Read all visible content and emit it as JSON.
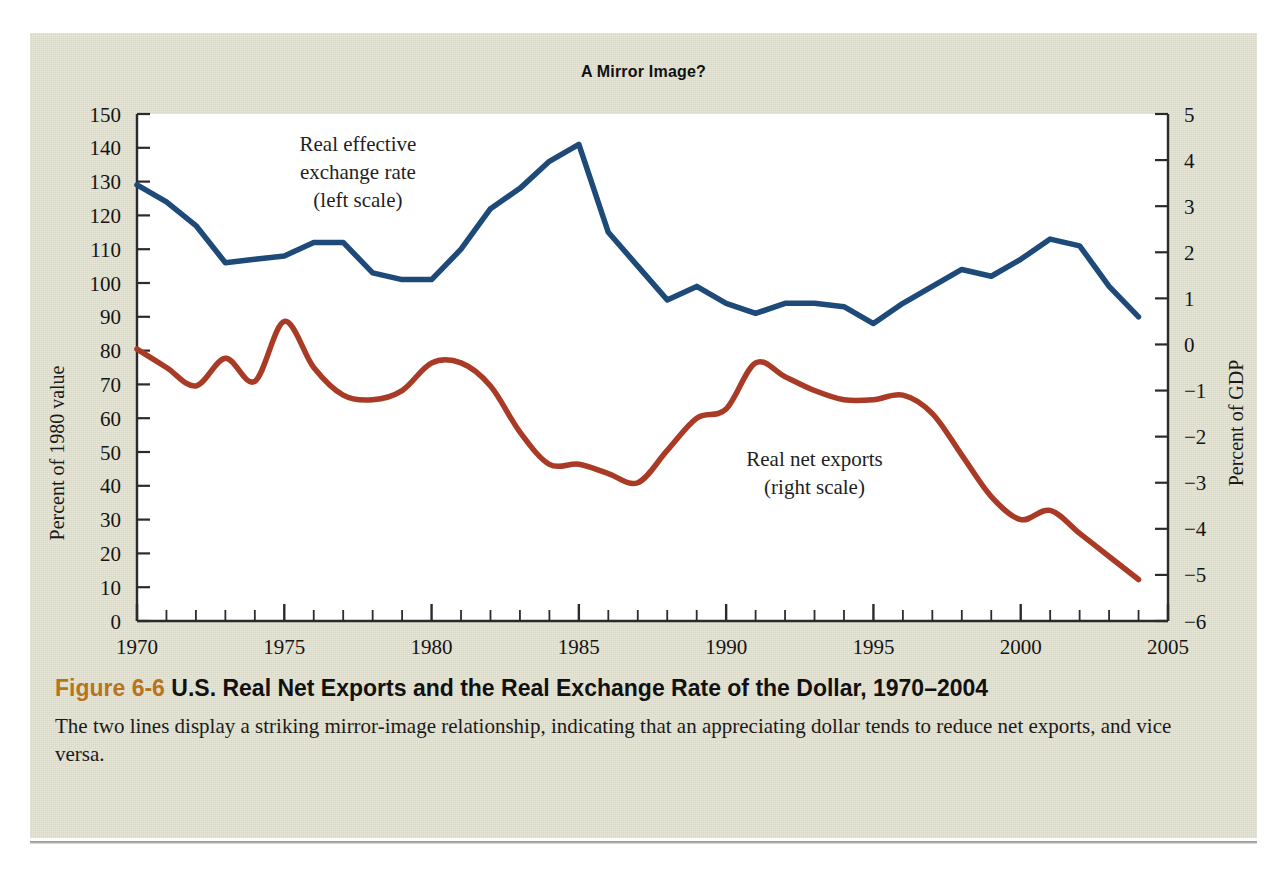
{
  "figure": {
    "chart_title": "A Mirror Image?",
    "caption_figure_number": "Figure 6-6",
    "caption_title": " U.S. Real Net Exports and the Real Exchange Rate of the Dollar, 1970–2004",
    "caption_body": "The two lines display a striking mirror-image relationship, indicating that an appreciating dollar tends to reduce net exports, and vice versa.",
    "accent_color": "#b8741a",
    "panel_color": "#d9d8c6"
  },
  "chart_data": {
    "type": "line",
    "title": "A Mirror Image?",
    "xlabel": "",
    "ylabel": "Percent of 1980 value",
    "y2label": "Percent of GDP",
    "xlim": [
      1970,
      2005
    ],
    "ylim": [
      0,
      150
    ],
    "y2lim": [
      -6,
      5
    ],
    "grid": false,
    "legend": "inline-annotations",
    "x_ticks": [
      1970,
      1975,
      1980,
      1985,
      1990,
      1995,
      2000,
      2005
    ],
    "x_minor_tick_step": 1,
    "y_ticks": [
      0,
      10,
      20,
      30,
      40,
      50,
      60,
      70,
      80,
      90,
      100,
      110,
      120,
      130,
      140,
      150
    ],
    "y2_ticks": [
      -6,
      -5,
      -4,
      -3,
      -2,
      -1,
      0,
      1,
      2,
      3,
      4,
      5
    ],
    "x": [
      1970,
      1971,
      1972,
      1973,
      1974,
      1975,
      1976,
      1977,
      1978,
      1979,
      1980,
      1981,
      1982,
      1983,
      1984,
      1985,
      1986,
      1987,
      1988,
      1989,
      1990,
      1991,
      1992,
      1993,
      1994,
      1995,
      1996,
      1997,
      1998,
      1999,
      2000,
      2001,
      2002,
      2003,
      2004
    ],
    "series": [
      {
        "name": "Real effective exchange rate",
        "scale_note": "(left scale)",
        "axis": "left",
        "color": "#1d4a78",
        "units": "Percent of 1980 value",
        "values": [
          129,
          124,
          117,
          106,
          107,
          108,
          112,
          112,
          103,
          101,
          101,
          110,
          122,
          128,
          136,
          141,
          115,
          105,
          95,
          99,
          94,
          91,
          94,
          94,
          93,
          88,
          94,
          99,
          104,
          102,
          107,
          113,
          111,
          99,
          90
        ]
      },
      {
        "name": "Real net exports",
        "scale_note": "(right scale)",
        "axis": "right",
        "color": "#a93b26",
        "units": "Percent of GDP",
        "values": [
          -0.1,
          -0.5,
          -0.9,
          -0.3,
          -0.8,
          0.5,
          -0.5,
          -1.1,
          -1.2,
          -1.0,
          -0.4,
          -0.4,
          -0.9,
          -1.9,
          -2.6,
          -2.6,
          -2.8,
          -3.0,
          -2.3,
          -1.6,
          -1.4,
          -0.4,
          -0.7,
          -1.0,
          -1.2,
          -1.2,
          -1.1,
          -1.5,
          -2.4,
          -3.3,
          -3.8,
          -3.6,
          -4.1,
          -4.6,
          -5.1
        ]
      }
    ],
    "annotations": [
      {
        "name": "blue-series-label",
        "text": "Real effective\nexchange rate\n(left scale)",
        "x": 1977.5,
        "y": 139
      },
      {
        "name": "red-series-label",
        "text": "Real net exports\n(right scale)",
        "x": 1993.0,
        "y": 46
      }
    ]
  },
  "axes": {
    "left_title": "Percent of 1980 value",
    "right_title": "Percent of GDP"
  }
}
